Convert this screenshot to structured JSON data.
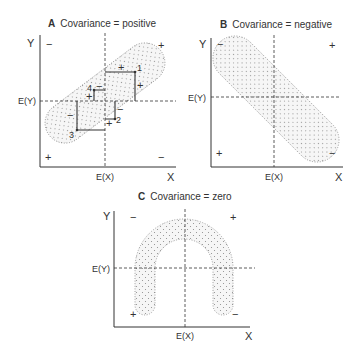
{
  "panels": [
    {
      "letter": "A",
      "title": "Covariance = positive",
      "y_axis": "Y",
      "x_axis": "X",
      "mean_y": "E(Y)",
      "mean_x": "E(X)",
      "quadrant_signs": {
        "top_left": "−",
        "top_right": "+",
        "bottom_left": "+",
        "bottom_right": "−"
      },
      "points": [
        "1",
        "2",
        "3",
        "4"
      ],
      "rect_signs": [
        "+",
        "+",
        "−",
        "+",
        "−",
        "+",
        "−"
      ]
    },
    {
      "letter": "B",
      "title": "Covariance = negative",
      "y_axis": "Y",
      "x_axis": "X",
      "mean_y": "E(Y)",
      "mean_x": "E(X)",
      "quadrant_signs": {
        "top_left": "−",
        "top_right": "+",
        "bottom_left": "+",
        "bottom_right": "−"
      }
    },
    {
      "letter": "C",
      "title": "Covariance = zero",
      "y_axis": "Y",
      "x_axis": "X",
      "mean_y": "E(Y)",
      "mean_x": "E(X)",
      "quadrant_signs": {
        "top_left": "−",
        "top_right": "+",
        "bottom_left": "+",
        "bottom_right": "−"
      }
    }
  ],
  "colors": {
    "ink": "#333333",
    "dots": "#8a8a8a",
    "fill": "#f4f4f4"
  }
}
